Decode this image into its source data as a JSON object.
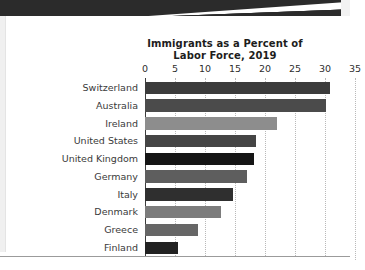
{
  "page": {
    "background_color": "#ffffff",
    "banner_color": "#2b2b2b"
  },
  "chart_data": {
    "type": "bar",
    "orientation": "horizontal",
    "title": "Immigrants as a Percent of Labor Force, 2019",
    "title_line_1": "Immigrants as a Percent of",
    "title_line_2": "Labor Force, 2019",
    "xlabel": "",
    "ylabel": "",
    "xlim": [
      0,
      35
    ],
    "ylim": null,
    "grid": true,
    "grid_axis": "x",
    "grid_style": "dotted",
    "legend": false,
    "legend_position": "none",
    "tick_labels": [
      "0",
      "5",
      "10",
      "15",
      "20",
      "25",
      "30",
      "35"
    ],
    "ticks": [
      0,
      5,
      10,
      15,
      20,
      25,
      30,
      35
    ],
    "categories": [
      "Switzerland",
      "Australia",
      "Ireland",
      "United States",
      "United Kingdom",
      "Germany",
      "Italy",
      "Denmark",
      "Greece",
      "Finland"
    ],
    "values": [
      30.8,
      30.2,
      22.0,
      18.5,
      18.2,
      17.0,
      14.7,
      12.7,
      8.8,
      5.5
    ],
    "bar_colors": [
      "#3c3c3c",
      "#4b4b4b",
      "#8d8d8d",
      "#454545",
      "#151515",
      "#5e5e5e",
      "#2f2f2f",
      "#7c7c7c",
      "#666666",
      "#222222"
    ],
    "bars": [
      {
        "category": "Switzerland",
        "value": 30.8,
        "color": "#3c3c3c"
      },
      {
        "category": "Australia",
        "value": 30.2,
        "color": "#4b4b4b"
      },
      {
        "category": "Ireland",
        "value": 22.0,
        "color": "#8d8d8d"
      },
      {
        "category": "United States",
        "value": 18.5,
        "color": "#454545"
      },
      {
        "category": "United Kingdom",
        "value": 18.2,
        "color": "#151515"
      },
      {
        "category": "Germany",
        "value": 17.0,
        "color": "#5e5e5e"
      },
      {
        "category": "Italy",
        "value": 14.7,
        "color": "#2f2f2f"
      },
      {
        "category": "Denmark",
        "value": 12.7,
        "color": "#7c7c7c"
      },
      {
        "category": "Greece",
        "value": 8.8,
        "color": "#666666"
      },
      {
        "category": "Finland",
        "value": 5.5,
        "color": "#222222"
      }
    ]
  }
}
